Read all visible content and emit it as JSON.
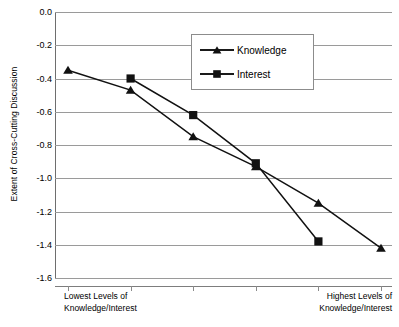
{
  "chart_data": {
    "type": "line",
    "title": "",
    "xlabel": "",
    "ylabel": "Extent of Cross-Cutting Discussion",
    "ylim": [
      -1.6,
      0.0
    ],
    "ytick_labels": [
      "0.0",
      "-0.2",
      "-0.4",
      "-0.6",
      "-0.8",
      "-1.0",
      "-1.2",
      "-1.4",
      "-1.6"
    ],
    "ytick_values": [
      0.0,
      -0.2,
      -0.4,
      -0.6,
      -0.8,
      -1.0,
      -1.2,
      -1.4,
      -1.6
    ],
    "grid": true,
    "legend_position": "top-center-right",
    "x": [
      1,
      2,
      3,
      4,
      5,
      6
    ],
    "categories": [
      "1",
      "2",
      "3",
      "4",
      "5",
      "6"
    ],
    "x_axis_end_labels": {
      "left_line1": "Lowest Levels of",
      "left_line2": "Knowledge/Interest",
      "right_line1": "Highest Levels of",
      "right_line2": "Knowledge/Interest"
    },
    "series": [
      {
        "name": "Knowledge",
        "marker": "triangle",
        "color": "#111111",
        "x": [
          1,
          2,
          3,
          4,
          5,
          6
        ],
        "values": [
          -0.35,
          -0.47,
          -0.75,
          -0.93,
          -1.15,
          -1.42
        ]
      },
      {
        "name": "Interest",
        "marker": "square",
        "color": "#111111",
        "x": [
          2,
          3,
          4,
          5
        ],
        "values": [
          -0.4,
          -0.62,
          -0.91,
          -1.38
        ]
      }
    ]
  },
  "legend": {
    "items": [
      {
        "label": "Knowledge",
        "marker": "triangle"
      },
      {
        "label": "Interest",
        "marker": "square"
      }
    ]
  }
}
